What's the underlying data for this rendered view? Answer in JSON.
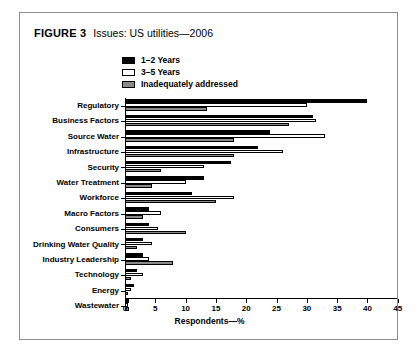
{
  "figure": {
    "tag": "FIGURE 3",
    "title": "Issues: US utilities—2006"
  },
  "legend": {
    "position": "top-center",
    "entries": [
      {
        "label": "1–2 Years",
        "color": "#000000",
        "swatch": "sw-black"
      },
      {
        "label": "3–5 Years",
        "color": "#ffffff",
        "swatch": "sw-white"
      },
      {
        "label": "Inadequately addressed",
        "color": "#8a8a8a",
        "swatch": "sw-gray"
      }
    ]
  },
  "chart_data": {
    "type": "bar",
    "orientation": "horizontal",
    "title": "Issues: US utilities—2006",
    "xlabel": "Respondents—%",
    "ylabel": "",
    "xlim": [
      0,
      45
    ],
    "xticks": [
      0,
      5,
      10,
      15,
      20,
      25,
      30,
      35,
      40,
      45
    ],
    "grid": false,
    "categories": [
      "Regulatory",
      "Business Factors",
      "Source Water",
      "Infrastructure",
      "Security",
      "Water Treatment",
      "Workforce",
      "Macro Factors",
      "Consumers",
      "Drinking Water Quality",
      "Industry Leadership",
      "Technology",
      "Energy",
      "Wastewater"
    ],
    "series": [
      {
        "name": "1–2 Years",
        "color": "#000000",
        "values": [
          40,
          31,
          24,
          22,
          17.5,
          13,
          11,
          4,
          4,
          3,
          3,
          2,
          1.5,
          0.6
        ]
      },
      {
        "name": "3–5 Years",
        "color": "#ffffff",
        "values": [
          30,
          31.5,
          33,
          26,
          13,
          10,
          18,
          6,
          5.5,
          4.5,
          4,
          3,
          1,
          0.5
        ]
      },
      {
        "name": "Inadequately addressed",
        "color": "#8a8a8a",
        "values": [
          13.5,
          27,
          18,
          18,
          6,
          4.5,
          15,
          3,
          10,
          2,
          8,
          1,
          0.5,
          0.6
        ]
      }
    ]
  }
}
